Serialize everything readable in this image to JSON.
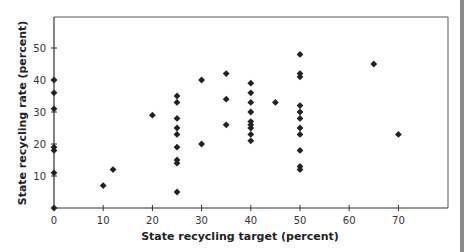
{
  "chart_data": {
    "type": "scatter",
    "title": "",
    "xlabel": "State recycling target (percent)",
    "ylabel": "State recycling rate (percent)",
    "xlim": [
      0,
      80
    ],
    "ylim": [
      0,
      60
    ],
    "xticks": [
      0,
      10,
      20,
      30,
      40,
      50,
      60,
      70
    ],
    "yticks": [
      10,
      20,
      30,
      40,
      50
    ],
    "grid": false,
    "legend": null,
    "marker": "diamond",
    "marker_color": "#222222",
    "points": [
      {
        "x": 0,
        "y": 40
      },
      {
        "x": 0,
        "y": 36
      },
      {
        "x": 0,
        "y": 31
      },
      {
        "x": 0,
        "y": 19
      },
      {
        "x": 0,
        "y": 18
      },
      {
        "x": 0,
        "y": 11
      },
      {
        "x": 0,
        "y": 0
      },
      {
        "x": 10,
        "y": 7
      },
      {
        "x": 12,
        "y": 12
      },
      {
        "x": 20,
        "y": 29
      },
      {
        "x": 25,
        "y": 35
      },
      {
        "x": 25,
        "y": 33
      },
      {
        "x": 25,
        "y": 28
      },
      {
        "x": 25,
        "y": 25
      },
      {
        "x": 25,
        "y": 23
      },
      {
        "x": 25,
        "y": 19
      },
      {
        "x": 25,
        "y": 15
      },
      {
        "x": 25,
        "y": 14
      },
      {
        "x": 25,
        "y": 5
      },
      {
        "x": 30,
        "y": 40
      },
      {
        "x": 30,
        "y": 20
      },
      {
        "x": 35,
        "y": 42
      },
      {
        "x": 35,
        "y": 34
      },
      {
        "x": 35,
        "y": 26
      },
      {
        "x": 40,
        "y": 39
      },
      {
        "x": 40,
        "y": 36
      },
      {
        "x": 40,
        "y": 33
      },
      {
        "x": 40,
        "y": 30
      },
      {
        "x": 40,
        "y": 27
      },
      {
        "x": 40,
        "y": 26
      },
      {
        "x": 40,
        "y": 25
      },
      {
        "x": 40,
        "y": 23
      },
      {
        "x": 40,
        "y": 21
      },
      {
        "x": 45,
        "y": 33
      },
      {
        "x": 50,
        "y": 48
      },
      {
        "x": 50,
        "y": 42
      },
      {
        "x": 50,
        "y": 41
      },
      {
        "x": 50,
        "y": 32
      },
      {
        "x": 50,
        "y": 30
      },
      {
        "x": 50,
        "y": 28
      },
      {
        "x": 50,
        "y": 25
      },
      {
        "x": 50,
        "y": 23
      },
      {
        "x": 50,
        "y": 18
      },
      {
        "x": 50,
        "y": 13
      },
      {
        "x": 50,
        "y": 12
      },
      {
        "x": 65,
        "y": 45
      },
      {
        "x": 70,
        "y": 23
      }
    ]
  }
}
